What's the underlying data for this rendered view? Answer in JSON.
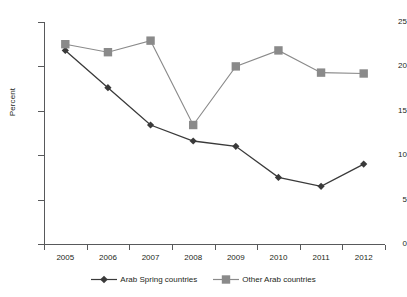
{
  "chart_data": {
    "type": "line",
    "title": "",
    "xlabel": "",
    "ylabel": "Percent",
    "ylim": [
      0,
      25
    ],
    "ytick_values": [
      0,
      5,
      10,
      15,
      20,
      25
    ],
    "ytick_labels": [
      "0",
      "5",
      "10",
      "15",
      "20",
      "25"
    ],
    "grid": false,
    "legend_position": "bottom-center",
    "categories": [
      "2005",
      "2006",
      "2007",
      "2008",
      "2009",
      "2010",
      "2011",
      "2012"
    ],
    "series": [
      {
        "name": "Arab Spring countries",
        "color": "#3a3a3a",
        "marker": "diamond",
        "values": [
          21.8,
          17.6,
          13.4,
          11.6,
          11.0,
          7.5,
          6.5,
          9.0
        ]
      },
      {
        "name": "Other Arab countries",
        "color": "#8a8a8a",
        "marker": "square",
        "values": [
          22.5,
          21.6,
          22.9,
          13.4,
          20.0,
          21.8,
          19.3,
          19.2
        ]
      }
    ]
  },
  "axis": {
    "y_title": "Percent"
  },
  "legend": {
    "items": [
      {
        "label": "Arab Spring countries",
        "marker": "diamond-marker",
        "color": "#3a3a3a"
      },
      {
        "label": "Other Arab countries",
        "marker": "square-marker",
        "color": "#8a8a8a"
      }
    ]
  }
}
